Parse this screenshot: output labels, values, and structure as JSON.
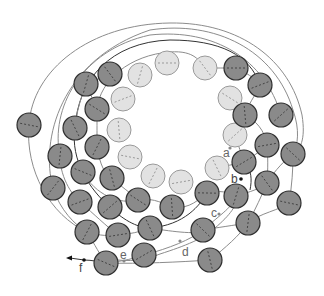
{
  "diagram": {
    "colors": {
      "dark_fill": "#8a8a8a",
      "dark_stroke": "#2f2f2f",
      "light_fill": "#e2e2e2",
      "light_stroke": "#9a9a9a",
      "line": "#8c8c8c",
      "line_dark": "#333333",
      "label": "#666666"
    },
    "labels": {
      "a": "a",
      "b": "b",
      "c": "c",
      "d": "d",
      "e": "e",
      "f": "f"
    },
    "light_circles": [
      [
        167,
        63
      ],
      [
        205,
        68
      ],
      [
        140,
        75
      ],
      [
        123,
        99
      ],
      [
        230,
        98
      ],
      [
        119,
        130
      ],
      [
        235,
        135
      ],
      [
        130,
        157
      ],
      [
        217,
        168
      ],
      [
        153,
        176
      ],
      [
        181,
        182
      ]
    ],
    "dark_circles": [
      [
        236,
        68
      ],
      [
        110,
        74
      ],
      [
        86,
        84
      ],
      [
        260,
        85
      ],
      [
        97,
        109
      ],
      [
        245,
        115
      ],
      [
        281,
        115
      ],
      [
        29,
        125
      ],
      [
        75,
        128
      ],
      [
        97,
        147
      ],
      [
        267,
        145
      ],
      [
        293,
        154
      ],
      [
        60,
        156
      ],
      [
        244,
        162
      ],
      [
        83,
        172
      ],
      [
        112,
        178
      ],
      [
        53,
        188
      ],
      [
        207,
        193
      ],
      [
        267,
        183
      ],
      [
        236,
        196
      ],
      [
        80,
        202
      ],
      [
        138,
        200
      ],
      [
        172,
        207
      ],
      [
        110,
        207
      ],
      [
        289,
        203
      ],
      [
        150,
        228
      ],
      [
        87,
        232
      ],
      [
        118,
        235
      ],
      [
        203,
        230
      ],
      [
        248,
        223
      ],
      [
        144,
        255
      ],
      [
        106,
        263
      ],
      [
        210,
        260
      ]
    ],
    "radius": 12
  }
}
